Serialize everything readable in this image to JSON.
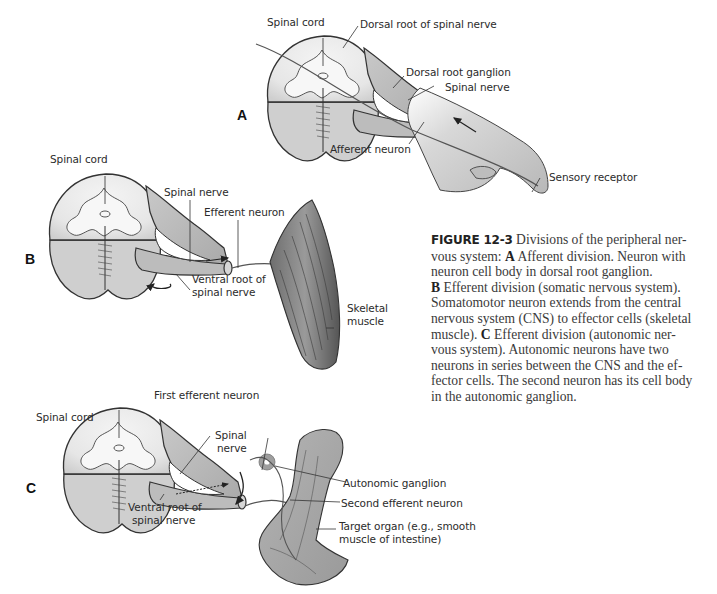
{
  "figure": {
    "number_label": "FIGURE 12-3",
    "caption_lines": [
      {
        "runs": [
          {
            "t": "FIGURE 12-3",
            "style": "fig"
          },
          {
            "t": "  Divisions of the peripheral ner-",
            "style": "normal"
          }
        ]
      },
      {
        "runs": [
          {
            "t": "vous system:  ",
            "style": "normal"
          },
          {
            "t": "A",
            "style": "bold"
          },
          {
            "t": " Afferent division. Neuron with",
            "style": "normal"
          }
        ]
      },
      {
        "runs": [
          {
            "t": "neuron cell body in dorsal root ganglion.",
            "style": "normal"
          }
        ]
      },
      {
        "runs": [
          {
            "t": "B",
            "style": "bold"
          },
          {
            "t": " Efferent division (somatic nervous system).",
            "style": "normal"
          }
        ]
      },
      {
        "runs": [
          {
            "t": "Somatomotor neuron extends from the central",
            "style": "normal"
          }
        ]
      },
      {
        "runs": [
          {
            "t": "nervous system (CNS) to effector cells (skeletal",
            "style": "normal"
          }
        ]
      },
      {
        "runs": [
          {
            "t": "muscle).   ",
            "style": "normal"
          },
          {
            "t": "C",
            "style": "bold"
          },
          {
            "t": " Efferent division (autonomic ner-",
            "style": "normal"
          }
        ]
      },
      {
        "runs": [
          {
            "t": "vous system). Autonomic neurons have two",
            "style": "normal"
          }
        ]
      },
      {
        "runs": [
          {
            "t": "neurons in series between the CNS and the ef-",
            "style": "normal"
          }
        ]
      },
      {
        "runs": [
          {
            "t": "fector cells. The second neuron has its cell body",
            "style": "normal"
          }
        ]
      },
      {
        "runs": [
          {
            "t": "in the autonomic ganglion.",
            "style": "normal"
          }
        ]
      }
    ]
  },
  "panels": {
    "A": {
      "letter": "A",
      "labels": {
        "spinal_cord": "Spinal cord",
        "dorsal_root": "Dorsal root of spinal nerve",
        "dorsal_root_ganglion": "Dorsal root ganglion",
        "spinal_nerve": "Spinal nerve",
        "afferent_neuron": "Afferent neuron",
        "sensory_receptor": "Sensory receptor"
      }
    },
    "B": {
      "letter": "B",
      "labels": {
        "spinal_cord": "Spinal cord",
        "spinal_nerve": "Spinal nerve",
        "efferent_neuron": "Efferent neuron",
        "ventral_root_1": "Ventral root of",
        "ventral_root_2": "spinal nerve",
        "skeletal_muscle_1": "Skeletal",
        "skeletal_muscle_2": "muscle"
      }
    },
    "C": {
      "letter": "C",
      "labels": {
        "spinal_cord": "Spinal cord",
        "first_efferent_neuron": "First efferent neuron",
        "spinal_nerve_1": "Spinal",
        "spinal_nerve_2": "nerve",
        "autonomic_ganglion": "Autonomic ganglion",
        "second_efferent_neuron": "Second efferent neuron",
        "ventral_root_1": "Ventral root of",
        "ventral_root_2": "spinal nerve",
        "target_organ_1": "Target organ (e.g., smooth",
        "target_organ_2": "muscle of intestine)"
      }
    }
  },
  "colors": {
    "background": "#ffffff",
    "white_matter": "#eeeeee",
    "gray_tissue": "#bdbdbd",
    "outline": "#333333",
    "text": "#2b2b2b"
  }
}
